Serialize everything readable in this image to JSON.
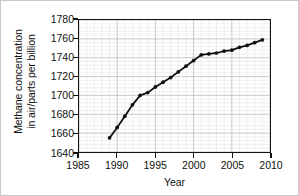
{
  "chart_data": {
    "type": "line",
    "title": "",
    "xlabel": "Year",
    "ylabel_line1": "Methane concentration",
    "ylabel_line2": "in air/parts per billion",
    "xlim": [
      1985,
      2010
    ],
    "ylim": [
      1640,
      1780
    ],
    "xticks": [
      1985,
      1990,
      1995,
      2000,
      2005,
      2010
    ],
    "yticks": [
      1640,
      1660,
      1680,
      1700,
      1720,
      1740,
      1760,
      1780
    ],
    "xtick_labels": [
      "1985",
      "1990",
      "1995",
      "2000",
      "2005",
      "2010"
    ],
    "ytick_labels": [
      "1640",
      "1660",
      "1680",
      "1700",
      "1720",
      "1740",
      "1760",
      "1780"
    ],
    "x_minor_step": 1,
    "y_minor_step": 4,
    "grid": true,
    "grid_minor": true,
    "legend": "none",
    "marker": "filled-circle",
    "line_color": "#111111",
    "marker_color": "#111111",
    "grid_color": "#c4c4c4",
    "grid_minor_color": "#dedede",
    "axis_color": "#111111",
    "background": "#ffffff",
    "x": [
      1989,
      1990,
      1991,
      1992,
      1993,
      1994,
      1995,
      1996,
      1997,
      1998,
      1999,
      2000,
      2001,
      2002,
      2003,
      2004,
      2005,
      2006,
      2007,
      2008,
      2009
    ],
    "values": [
      1655,
      1666,
      1678,
      1690,
      1700,
      1703,
      1709,
      1714,
      1719,
      1725,
      1731,
      1737,
      1743,
      1744,
      1745,
      1747,
      1748,
      1751,
      1753,
      1756,
      1759
    ],
    "series": [
      {
        "name": "Methane concentration in air",
        "values": [
          1655,
          1666,
          1678,
          1690,
          1700,
          1703,
          1709,
          1714,
          1719,
          1725,
          1731,
          1737,
          1743,
          1744,
          1745,
          1747,
          1748,
          1751,
          1753,
          1756,
          1759
        ]
      }
    ]
  }
}
